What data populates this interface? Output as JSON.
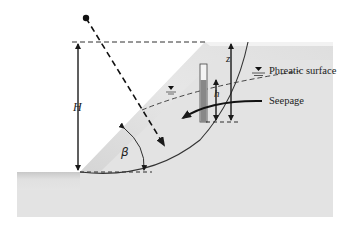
{
  "figure": {
    "type": "slope-stability-diagram",
    "labels": {
      "height": "H",
      "slope_angle": "β",
      "depth": "z",
      "piezometric_head": "h",
      "phreatic_surface": "Phreatic surface",
      "seepage": "Seepage"
    },
    "colors": {
      "background": "#ffffff",
      "soil": "#e2e2e2",
      "soil_shade": "#cfcfcf",
      "line": "#1a1a1a",
      "piezometer_fill": "#8a8a8a"
    }
  }
}
